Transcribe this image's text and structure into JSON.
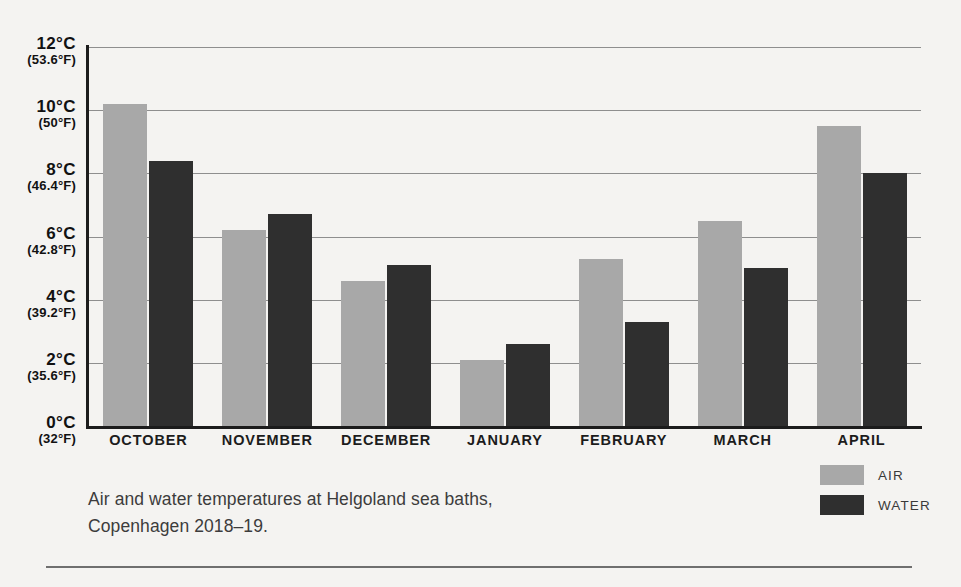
{
  "chart_data": {
    "type": "bar",
    "title": "",
    "xlabel": "",
    "ylabel": "",
    "ylim": [
      0,
      12
    ],
    "grid": true,
    "legend_position": "bottom-right",
    "categories": [
      "OCTOBER",
      "NOVEMBER",
      "DECEMBER",
      "JANUARY",
      "FEBRUARY",
      "MARCH",
      "APRIL"
    ],
    "series": [
      {
        "name": "AIR",
        "color": "#a8a8a8",
        "values": [
          10.2,
          6.2,
          4.6,
          2.1,
          5.3,
          6.5,
          9.5
        ]
      },
      {
        "name": "WATER",
        "color": "#2f2f2f",
        "values": [
          8.4,
          6.7,
          5.1,
          2.6,
          3.3,
          5.0,
          8.0
        ]
      }
    ],
    "yticks": [
      {
        "celsius": "12°C",
        "fahrenheit": "(53.6°F)",
        "value": 12
      },
      {
        "celsius": "10°C",
        "fahrenheit": "(50°F)",
        "value": 10
      },
      {
        "celsius": "8°C",
        "fahrenheit": "(46.4°F)",
        "value": 8
      },
      {
        "celsius": "6°C",
        "fahrenheit": "(42.8°F)",
        "value": 6
      },
      {
        "celsius": "4°C",
        "fahrenheit": "(39.2°F)",
        "value": 4
      },
      {
        "celsius": "2°C",
        "fahrenheit": "(35.6°F)",
        "value": 2
      },
      {
        "celsius": "0°C",
        "fahrenheit": "(32°F)",
        "value": 0
      }
    ],
    "caption_lines": [
      "Air and water temperatures at Helgoland sea baths,",
      "Copenhagen 2018–19."
    ]
  }
}
